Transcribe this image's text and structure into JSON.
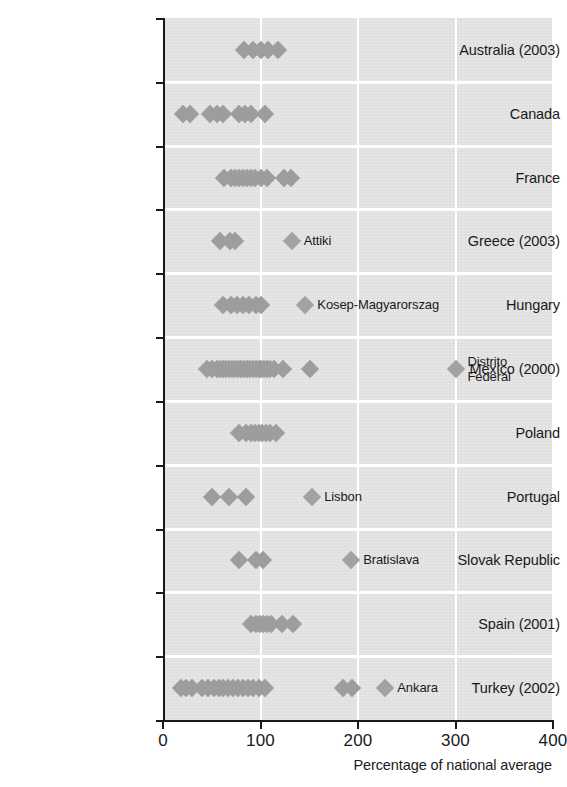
{
  "chart_data": {
    "type": "scatter",
    "title": "",
    "xlabel": "Percentage of national average",
    "ylabel": "",
    "xlim": [
      0,
      400
    ],
    "xticks": [
      0,
      100,
      200,
      300,
      400
    ],
    "xtick_labels": [
      "0",
      "100",
      "200",
      "300",
      "400"
    ],
    "grid": true,
    "grid_orientation": "vertical",
    "legend": "none",
    "marker": "diamond",
    "marker_color": "#9d9d9d",
    "plot_background": "#e2e2e2",
    "categories": [
      "Australia (2003)",
      "Canada",
      "France",
      "Greece (2003)",
      "Hungary",
      "Mexico (2000)",
      "Poland",
      "Portugal",
      "Slovak Republic",
      "Spain (2001)",
      "Turkey (2002)"
    ],
    "rows": [
      {
        "category": "Australia (2003)",
        "values": [
          83,
          92,
          100,
          108,
          118
        ],
        "annotations": []
      },
      {
        "category": "Canada",
        "values": [
          20,
          28,
          48,
          55,
          62,
          78,
          84,
          90,
          105
        ],
        "annotations": []
      },
      {
        "category": "France",
        "values": [
          63,
          70,
          74,
          78,
          82,
          86,
          90,
          94,
          100,
          107,
          124,
          131
        ],
        "annotations": []
      },
      {
        "category": "Greece (2003)",
        "values": [
          58,
          69,
          74
        ],
        "annotations": [
          {
            "label": "Attiki",
            "value": 132
          }
        ]
      },
      {
        "category": "Hungary",
        "values": [
          62,
          70,
          76,
          82,
          88,
          95,
          100
        ],
        "annotations": [
          {
            "label": "Kosep-Magyarorszag",
            "value": 146
          }
        ]
      },
      {
        "category": "Mexico (2000)",
        "values": [
          45,
          50,
          55,
          58,
          62,
          65,
          68,
          71,
          74,
          77,
          80,
          83,
          86,
          89,
          92,
          95,
          98,
          101,
          104,
          107,
          110,
          114,
          123,
          151
        ],
        "annotations": [
          {
            "label": "Distrito\nFederal",
            "value": 300
          }
        ]
      },
      {
        "category": "Poland",
        "values": [
          78,
          85,
          90,
          94,
          98,
          102,
          106,
          110,
          116
        ],
        "annotations": []
      },
      {
        "category": "Portugal",
        "values": [
          50,
          68,
          85
        ],
        "annotations": [
          {
            "label": "Lisbon",
            "value": 153
          }
        ]
      },
      {
        "category": "Slovak Republic",
        "values": [
          78,
          95,
          103
        ],
        "annotations": [
          {
            "label": "Bratislava",
            "value": 193
          }
        ]
      },
      {
        "category": "Spain (2001)",
        "values": [
          90,
          95,
          99,
          103,
          107,
          111,
          122,
          133
        ],
        "annotations": []
      },
      {
        "category": "Turkey (2002)",
        "values": [
          18,
          24,
          30,
          40,
          46,
          52,
          57,
          62,
          67,
          72,
          77,
          82,
          87,
          92,
          98,
          105,
          185,
          194
        ],
        "annotations": [
          {
            "label": "Ankara",
            "value": 228
          }
        ]
      }
    ]
  }
}
